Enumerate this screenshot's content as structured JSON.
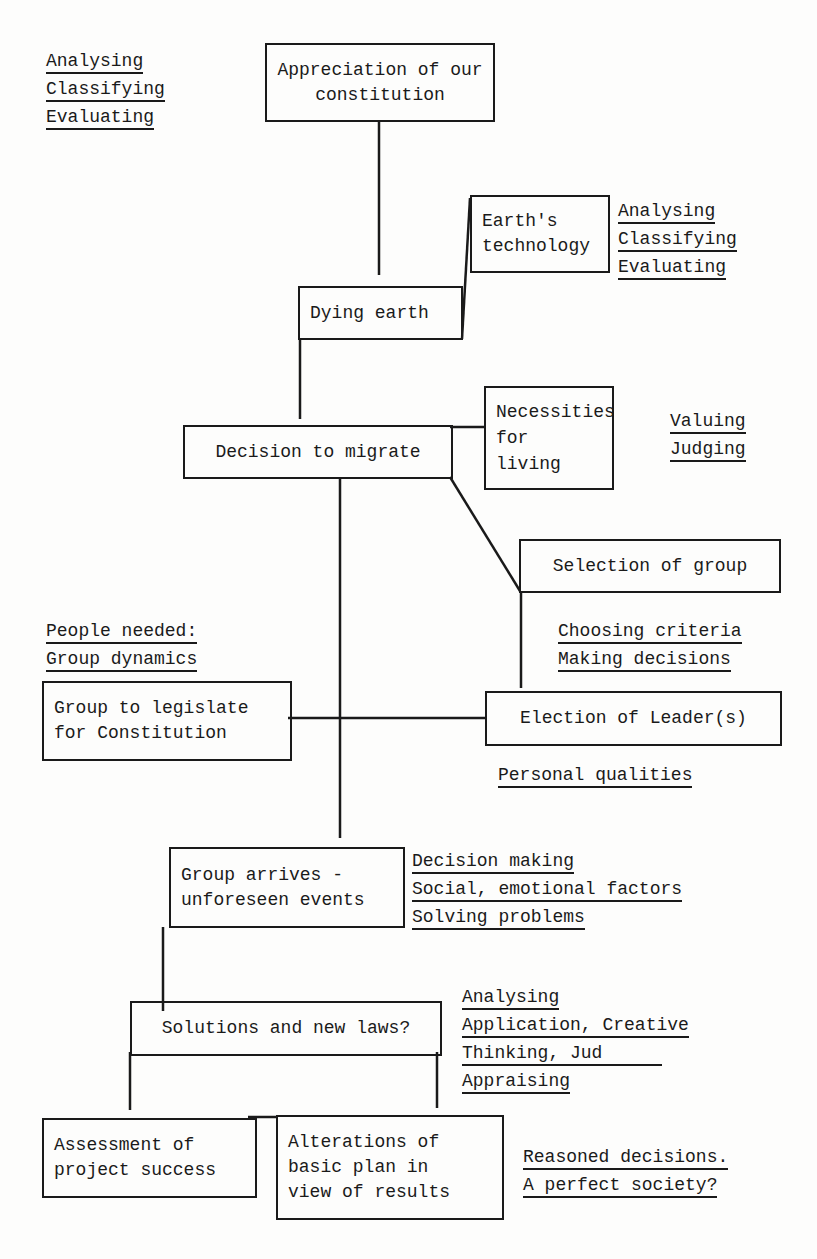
{
  "diagram": {
    "nodes": [
      {
        "id": "appreciation",
        "label": "Appreciation of our\nconstitution"
      },
      {
        "id": "earths_technology",
        "label": "Earth's\ntechnology"
      },
      {
        "id": "dying_earth",
        "label": "Dying earth"
      },
      {
        "id": "decision_to_migrate",
        "label": "Decision to migrate"
      },
      {
        "id": "necessities",
        "label": "Necessities\nfor\nliving"
      },
      {
        "id": "selection_of_group",
        "label": "Selection of group"
      },
      {
        "id": "group_to_legislate",
        "label": "Group to legislate\nfor Constitution"
      },
      {
        "id": "election_of_leaders",
        "label": "Election of Leader(s)"
      },
      {
        "id": "group_arrives",
        "label": "Group arrives -\nunforeseen events"
      },
      {
        "id": "solutions",
        "label": "Solutions and new laws?"
      },
      {
        "id": "assessment",
        "label": "Assessment of\nproject success"
      },
      {
        "id": "alterations",
        "label": "Alterations of\nbasic plan in\nview of results"
      }
    ],
    "skills": {
      "top_left": [
        "Analysing",
        "Classifying",
        "Evaluating"
      ],
      "earths_technology": [
        "Analysing",
        "Classifying",
        "Evaluating"
      ],
      "necessities": [
        "Valuing",
        "Judging"
      ],
      "selection": [
        "Choosing criteria",
        "Making decisions"
      ],
      "people_needed": [
        "People needed:",
        "Group dynamics"
      ],
      "election": [
        "Personal qualities"
      ],
      "group_arrives": [
        "Decision making",
        "Social, emotional factors",
        "Solving problems"
      ],
      "solutions": [
        "Analysing",
        "Application, Creative",
        "Thinking, Jud",
        "Appraising"
      ],
      "final": [
        "Reasoned decisions.",
        "A perfect society?"
      ]
    }
  }
}
